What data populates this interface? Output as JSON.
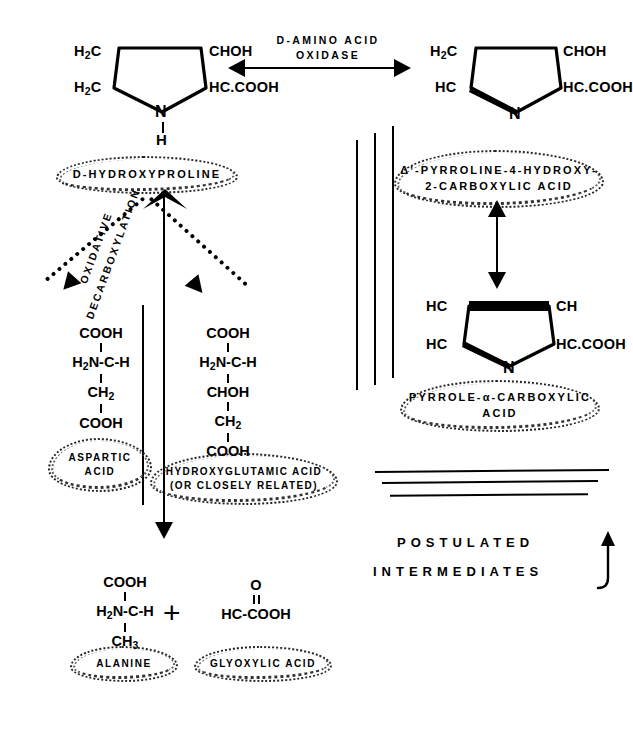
{
  "figure": {
    "type": "biochemical-pathway-diagram"
  },
  "reactions": {
    "oxidase_label_line1": "D-AMINO ACID",
    "oxidase_label_line2": "OXIDASE"
  },
  "structures": {
    "hydroxyproline_ring": {
      "top_left": "H",
      "top_left_sub": "2",
      "top_left_rest": "C",
      "top_right": "CHOH",
      "bottom_left": "H",
      "bottom_left_sub": "2",
      "bottom_left_rest": "C",
      "bottom_right": "HC.COOH",
      "ring_atom": "N",
      "nh_bond_atom": "H"
    },
    "pyrroline_ring": {
      "top_left": "H",
      "top_left_sub": "2",
      "top_left_rest": "C",
      "top_right": "CHOH",
      "bottom_left": "HC",
      "bottom_right": "HC.COOH",
      "ring_atom": "N"
    },
    "pyrrole_ring": {
      "top_left": "HC",
      "top_right": "CH",
      "bottom_left": "HC",
      "bottom_right": "HC.COOH",
      "ring_atom": "N"
    },
    "aspartic": {
      "rows": [
        "COOH",
        "H2N-C-H",
        "CH2",
        "COOH"
      ],
      "r0": "COOH",
      "r1_pre": "H",
      "r1_sub": "2",
      "r1_post": "N-C-H",
      "r2_pre": "CH",
      "r2_sub": "2",
      "r3": "COOH"
    },
    "hydroxyglutamic": {
      "r0": "COOH",
      "r1_pre": "H",
      "r1_sub": "2",
      "r1_post": "N-C-H",
      "r2": "CHOH",
      "r3_pre": "CH",
      "r3_sub": "2",
      "r4": "COOH"
    },
    "alanine": {
      "r0": "COOH",
      "r1_pre": "H",
      "r1_sub": "2",
      "r1_post": "N-C-H",
      "r2_pre": "CH",
      "r2_sub": "3"
    },
    "glyoxylic": {
      "r0": "O",
      "r1": "HC-COOH"
    },
    "plus_sign": "+"
  },
  "labels": {
    "d_hydroxyproline": "D-HYDROXYPROLINE",
    "pyrroline_line1": "Δ'-PYRROLINE-4-HYDROXY-",
    "pyrroline_line2": "2-CARBOXYLIC ACID",
    "pyrrole_line1": "PYRROLE-α-CARBOXYLIC",
    "pyrrole_line2": "ACID",
    "aspartic_line1": "ASPARTIC",
    "aspartic_line2": "ACID",
    "hydroxyglutamic_line1": "HYDROXYGLUTAMIC ACID",
    "hydroxyglutamic_line2": "(OR CLOSELY RELATED)",
    "alanine": "ALANINE",
    "glyoxylic": "GLYOXYLIC ACID",
    "oxidative_decarboxylation_line1": "OXIDATIVE",
    "oxidative_decarboxylation_line2": "DECARBOXYLATION",
    "postulated": "POSTULATED",
    "intermediates": "INTERMEDIATES"
  },
  "colors": {
    "ink": "#000000",
    "background": "#ffffff"
  }
}
